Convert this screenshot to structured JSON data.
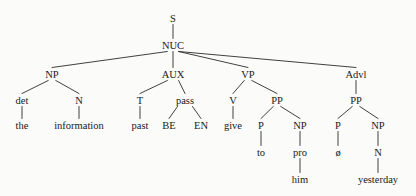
{
  "figure": {
    "name": "phrase-structure-tree",
    "background_color": "#fbfbfa",
    "ink_color": "#191919",
    "line_color": "#2b2b2b",
    "width": 416,
    "height": 196,
    "sentence": "the information past BE EN give to pro him ø yesterday"
  },
  "nodes": [
    {
      "id": "S",
      "label": "S",
      "x": 173,
      "y": 22,
      "kind": "nonterminal"
    },
    {
      "id": "NUC",
      "label": "NUC",
      "x": 173,
      "y": 49,
      "kind": "nonterminal"
    },
    {
      "id": "NP1",
      "label": "NP",
      "x": 52,
      "y": 78,
      "kind": "nonterminal"
    },
    {
      "id": "det",
      "label": "det",
      "x": 22,
      "y": 104,
      "kind": "nonterminal"
    },
    {
      "id": "N1",
      "label": "N",
      "x": 79,
      "y": 104,
      "kind": "nonterminal"
    },
    {
      "id": "the",
      "label": "the",
      "x": 22,
      "y": 129,
      "kind": "terminal"
    },
    {
      "id": "information",
      "label": "information",
      "x": 79,
      "y": 129,
      "kind": "terminal"
    },
    {
      "id": "AUX",
      "label": "AUX",
      "x": 173,
      "y": 78,
      "kind": "nonterminal"
    },
    {
      "id": "T",
      "label": "T",
      "x": 140,
      "y": 104,
      "kind": "nonterminal"
    },
    {
      "id": "pass",
      "label": "pass",
      "x": 185,
      "y": 104,
      "kind": "nonterminal"
    },
    {
      "id": "past",
      "label": "past",
      "x": 140,
      "y": 129,
      "kind": "terminal"
    },
    {
      "id": "BE",
      "label": "BE",
      "x": 169,
      "y": 129,
      "kind": "terminal"
    },
    {
      "id": "EN",
      "label": "EN",
      "x": 201,
      "y": 129,
      "kind": "terminal"
    },
    {
      "id": "VP",
      "label": "VP",
      "x": 248,
      "y": 78,
      "kind": "nonterminal"
    },
    {
      "id": "V",
      "label": "V",
      "x": 233,
      "y": 104,
      "kind": "nonterminal"
    },
    {
      "id": "PP1",
      "label": "PP",
      "x": 277,
      "y": 104,
      "kind": "nonterminal"
    },
    {
      "id": "give",
      "label": "give",
      "x": 233,
      "y": 129,
      "kind": "terminal"
    },
    {
      "id": "P1",
      "label": "P",
      "x": 261,
      "y": 129,
      "kind": "nonterminal"
    },
    {
      "id": "NP2",
      "label": "NP",
      "x": 300,
      "y": 129,
      "kind": "nonterminal"
    },
    {
      "id": "to",
      "label": "to",
      "x": 261,
      "y": 156,
      "kind": "terminal"
    },
    {
      "id": "pro",
      "label": "pro",
      "x": 300,
      "y": 156,
      "kind": "nonterminal"
    },
    {
      "id": "him",
      "label": "him",
      "x": 300,
      "y": 183,
      "kind": "terminal"
    },
    {
      "id": "Advl",
      "label": "Advl",
      "x": 356,
      "y": 78,
      "kind": "nonterminal"
    },
    {
      "id": "PP2",
      "label": "PP",
      "x": 356,
      "y": 104,
      "kind": "nonterminal"
    },
    {
      "id": "P2",
      "label": "P",
      "x": 338,
      "y": 129,
      "kind": "nonterminal"
    },
    {
      "id": "NP3",
      "label": "NP",
      "x": 378,
      "y": 129,
      "kind": "nonterminal"
    },
    {
      "id": "null",
      "label": "ø",
      "x": 338,
      "y": 156,
      "kind": "terminal"
    },
    {
      "id": "N2",
      "label": "N",
      "x": 378,
      "y": 156,
      "kind": "nonterminal"
    },
    {
      "id": "yesterday",
      "label": "yesterday",
      "x": 378,
      "y": 183,
      "kind": "terminal"
    }
  ],
  "edges": [
    {
      "from": "S",
      "to": "NUC"
    },
    {
      "from": "NUC",
      "to": "NP1"
    },
    {
      "from": "NUC",
      "to": "AUX"
    },
    {
      "from": "NUC",
      "to": "VP"
    },
    {
      "from": "NUC",
      "to": "Advl"
    },
    {
      "from": "NP1",
      "to": "det"
    },
    {
      "from": "NP1",
      "to": "N1"
    },
    {
      "from": "det",
      "to": "the"
    },
    {
      "from": "N1",
      "to": "information"
    },
    {
      "from": "AUX",
      "to": "T"
    },
    {
      "from": "AUX",
      "to": "pass"
    },
    {
      "from": "T",
      "to": "past"
    },
    {
      "from": "pass",
      "to": "BE"
    },
    {
      "from": "pass",
      "to": "EN"
    },
    {
      "from": "VP",
      "to": "V"
    },
    {
      "from": "VP",
      "to": "PP1"
    },
    {
      "from": "V",
      "to": "give"
    },
    {
      "from": "PP1",
      "to": "P1"
    },
    {
      "from": "PP1",
      "to": "NP2"
    },
    {
      "from": "P1",
      "to": "to"
    },
    {
      "from": "NP2",
      "to": "pro"
    },
    {
      "from": "pro",
      "to": "him"
    },
    {
      "from": "Advl",
      "to": "PP2"
    },
    {
      "from": "PP2",
      "to": "P2"
    },
    {
      "from": "PP2",
      "to": "NP3"
    },
    {
      "from": "P2",
      "to": "null"
    },
    {
      "from": "NP3",
      "to": "N2"
    },
    {
      "from": "N2",
      "to": "yesterday"
    }
  ]
}
